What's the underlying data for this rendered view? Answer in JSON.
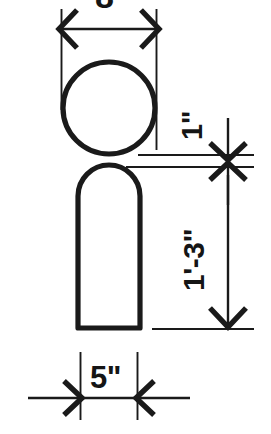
{
  "drawing": {
    "title": "Dimensioned figure elevation",
    "background_color": "#ffffff",
    "line_color": "#1a1a1a",
    "width_px": 271,
    "height_px": 434
  },
  "dimensions": {
    "head_width": {
      "label": "8\"",
      "name": "head-width-dimension",
      "orientation": "horizontal",
      "position": "top",
      "clipped": true
    },
    "neck_gap": {
      "label": "1\"",
      "name": "neck-gap-dimension",
      "orientation": "vertical",
      "position": "right-upper"
    },
    "body_height": {
      "label": "1'-3\"",
      "name": "body-height-dimension",
      "orientation": "vertical",
      "position": "right-lower"
    },
    "base_width": {
      "label": "5\"",
      "name": "base-width-dimension",
      "orientation": "horizontal",
      "position": "bottom"
    }
  },
  "shapes": {
    "head": {
      "name": "head-circle",
      "type": "circle",
      "cx": 109,
      "cy": 108,
      "r": 46
    },
    "body": {
      "name": "body-arch",
      "type": "rounded-rectangle",
      "x": 78,
      "y": 165,
      "width": 62,
      "height": 163,
      "corner_radius": 31
    }
  }
}
